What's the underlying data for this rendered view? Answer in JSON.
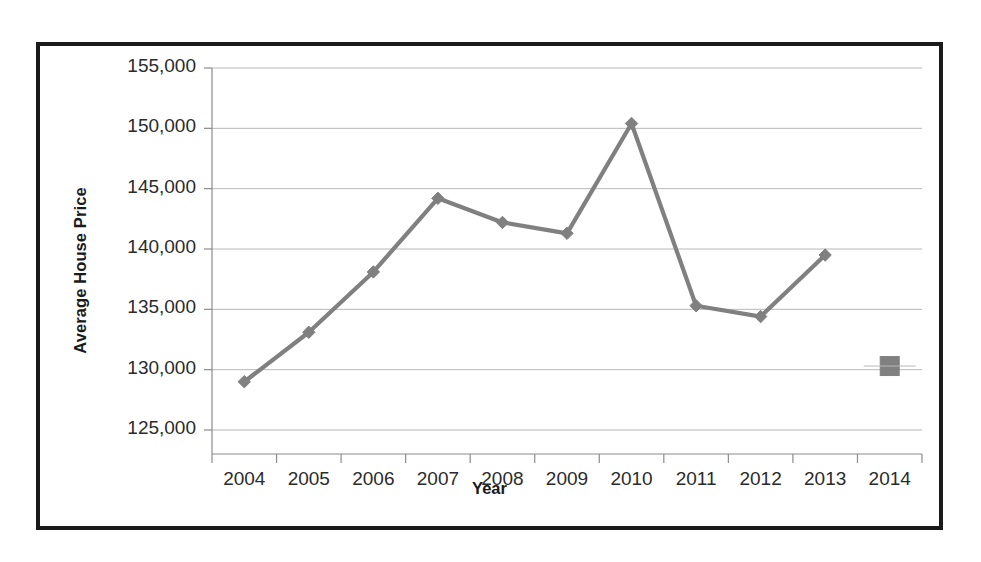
{
  "chart_data": {
    "type": "line",
    "title": "",
    "subtitle": "",
    "xlabel": "Year",
    "ylabel": "Average House Price",
    "categories": [
      "2004",
      "2005",
      "2006",
      "2007",
      "2008",
      "2009",
      "2010",
      "2011",
      "2012",
      "2013",
      "2014"
    ],
    "x": [
      2004,
      2005,
      2006,
      2007,
      2008,
      2009,
      2010,
      2011,
      2012,
      2013,
      2014
    ],
    "values": [
      129000,
      133100,
      138100,
      144200,
      142200,
      141300,
      150400,
      135300,
      134400,
      139500,
      130300
    ],
    "series": [
      {
        "name": "Average House Price",
        "values": [
          129000,
          133100,
          138100,
          144200,
          142200,
          141300,
          150400,
          135300,
          134400,
          139500,
          130300
        ],
        "connected_through_index": 9,
        "marker": "diamond",
        "last_point_marker": "square",
        "color": "#808080"
      }
    ],
    "ylim": [
      125000,
      155000
    ],
    "ytick_values": [
      125000,
      130000,
      135000,
      140000,
      145000,
      150000,
      155000
    ],
    "ytick_labels": [
      "125,000",
      "130,000",
      "135,000",
      "140,000",
      "145,000",
      "150,000",
      "155,000"
    ],
    "xtick_labels": [
      "2004",
      "2005",
      "2006",
      "2007",
      "2008",
      "2009",
      "2010",
      "2011",
      "2012",
      "2013",
      "2014"
    ],
    "grid": true,
    "grid_axis": "y",
    "legend": false,
    "legend_position": "none"
  },
  "colors": {
    "line": "#808080",
    "marker": "#808080",
    "gridline": "#b8b8b8",
    "axis": "#8c8c8c",
    "border": "#1a1a1a",
    "text": "#2b2b2b",
    "background": "#ffffff"
  },
  "axes": {
    "y_title": "Average House Price",
    "x_title": "Year"
  }
}
